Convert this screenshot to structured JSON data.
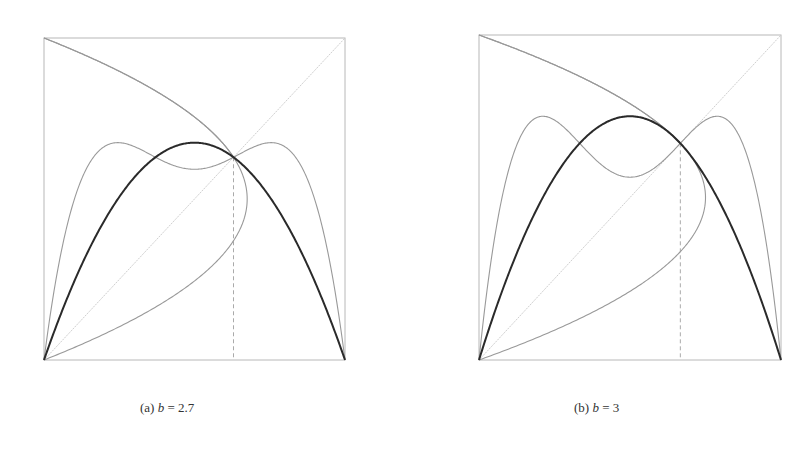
{
  "chart_data": [
    {
      "type": "line",
      "panel": "a",
      "caption": {
        "label": "(a)",
        "param": "b",
        "eq": "=",
        "value": "2.7"
      },
      "b": 2.7,
      "xlim": [
        0,
        1
      ],
      "ylim": [
        0,
        1
      ],
      "grid": false,
      "fixed_point_x": 0.6296,
      "series": [
        {
          "name": "f(x) = b x (1 - x)",
          "style": "bold-dark",
          "peak": 0.675
        },
        {
          "name": "f(f(x))",
          "style": "thin-gray",
          "peaks_x": [
            0.196,
            0.804
          ],
          "peak_y": 0.675,
          "local_min_at_x": 0.5
        },
        {
          "name": "inverse branches of f",
          "style": "thin-gray"
        },
        {
          "name": "diagonal y = x",
          "style": "faint-dotted"
        },
        {
          "name": "x = x* marker",
          "style": "dashed-vertical"
        }
      ]
    },
    {
      "type": "line",
      "panel": "b",
      "caption": {
        "label": "(b)",
        "param": "b",
        "eq": "=",
        "value": "3"
      },
      "b": 3,
      "xlim": [
        0,
        1
      ],
      "ylim": [
        0,
        1
      ],
      "grid": false,
      "fixed_point_x": 0.6667,
      "series": [
        {
          "name": "f(x) = b x (1 - x)",
          "style": "bold-dark",
          "peak": 0.75
        },
        {
          "name": "f(f(x))",
          "style": "thin-gray",
          "peaks_x": [
            0.211,
            0.789
          ],
          "peak_y": 0.75,
          "local_min_at_x": 0.5
        },
        {
          "name": "inverse branches of f",
          "style": "thin-gray"
        },
        {
          "name": "diagonal y = x",
          "style": "faint-dotted"
        },
        {
          "name": "x = x* marker",
          "style": "dashed-vertical"
        }
      ]
    }
  ],
  "layout": {
    "panels": [
      {
        "x0": 44,
        "y0": 38,
        "x1": 345,
        "y1": 360,
        "caption_x": 140,
        "caption_y": 400
      },
      {
        "x0": 479,
        "y0": 35,
        "x1": 781,
        "y1": 360,
        "caption_x": 574,
        "caption_y": 400
      }
    ],
    "colors": {
      "frame": "#b8b8b8",
      "thin": "#999999",
      "bold": "#2a2a2a",
      "diag": "#cfcfcf",
      "dash": "#aaaaaa"
    }
  }
}
